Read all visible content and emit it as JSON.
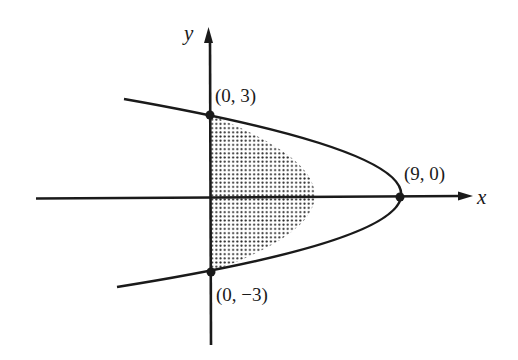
{
  "figure": {
    "type": "parabola-region",
    "equation_implied": "x = 9 - y^2",
    "axes": {
      "x_label": "x",
      "y_label": "y"
    },
    "points": [
      {
        "label": "(0, 3)",
        "x": 0,
        "y": 3
      },
      {
        "label": "(9, 0)",
        "x": 9,
        "y": 0
      },
      {
        "label": "(0, −3)",
        "x": 0,
        "y": -3
      }
    ],
    "shaded_region": "bounded by parabola and y-axis, 0 ≤ x ≤ 9 − y²",
    "colors": {
      "ink": "#1a1a1a",
      "background": "#ffffff",
      "stipple": "#2a2a2a"
    }
  }
}
